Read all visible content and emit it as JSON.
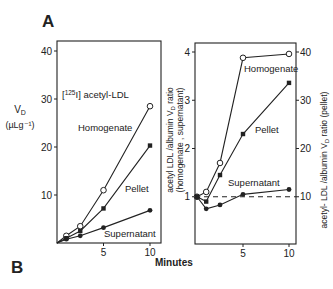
{
  "panels": {
    "a": "A",
    "b": "B"
  },
  "shared_xlabel": "Minutes",
  "chart_data": [
    {
      "type": "line",
      "title": "[125I] acetyl-LDL",
      "title_sup": "125",
      "title_pre": "[",
      "title_post": "I] acetyl-LDL",
      "xlabel": "Minutes",
      "ylabel_line1": "V",
      "ylabel_sub": "D",
      "ylabel_line2": "(µLg⁻¹)",
      "xlim": [
        0,
        10.5
      ],
      "ylim": [
        0,
        42
      ],
      "xticks": [
        5,
        10
      ],
      "yticks": [
        10,
        20,
        30,
        40
      ],
      "grid": false,
      "x": [
        0,
        1,
        2.5,
        5,
        10
      ],
      "series": [
        {
          "name": "Homogenate",
          "marker": "open-circle",
          "values": [
            0,
            1.5,
            3.5,
            11,
            28.5
          ]
        },
        {
          "name": "Pellet",
          "marker": "filled-square",
          "values": [
            0,
            1.0,
            2.5,
            7.2,
            20.3
          ]
        },
        {
          "name": "Supernatant",
          "marker": "filled-circle",
          "values": [
            0,
            0.8,
            1.5,
            3.2,
            6.8
          ]
        }
      ]
    },
    {
      "type": "line",
      "xlabel": "Minutes",
      "ylabel_left": "acetyl LDL /albumin V_D ratio (homogenate, supernatant)",
      "ylabel_left_l1a": "acetyl LDL /albumin V",
      "ylabel_left_l1sub": "D",
      "ylabel_left_l1b": " ratio",
      "ylabel_left_l2": "(homogenate , supernatant)",
      "ylabel_right": "acetyl- LDL /albumin V_D ratio (pellet)",
      "ylabel_right_a": "acetyl- LDL /albumin V",
      "ylabel_right_sub": "D",
      "ylabel_right_b": " ratio (pellet)",
      "xlim": [
        0,
        10.5
      ],
      "ylim_left": [
        0,
        4.2
      ],
      "ylim_right": [
        0,
        42
      ],
      "xticks": [
        5,
        10
      ],
      "yticks_left": [
        1,
        2,
        3,
        4
      ],
      "yticks_right": [
        10,
        20,
        30,
        40
      ],
      "reference_line": {
        "y_left": 1.0,
        "style": "dashed"
      },
      "grid": false,
      "x": [
        0,
        1,
        2.5,
        5,
        10
      ],
      "series": [
        {
          "name": "Homogenate",
          "axis": "left",
          "marker": "open-circle",
          "values": [
            1.0,
            1.1,
            1.7,
            3.88,
            3.96
          ]
        },
        {
          "name": "Pellet",
          "axis": "right",
          "marker": "filled-square",
          "values": [
            10,
            9,
            14.5,
            23,
            33.6
          ]
        },
        {
          "name": "Supernatant",
          "axis": "left",
          "marker": "filled-circle",
          "values": [
            1.0,
            0.75,
            0.83,
            1.05,
            1.15
          ]
        }
      ]
    }
  ]
}
